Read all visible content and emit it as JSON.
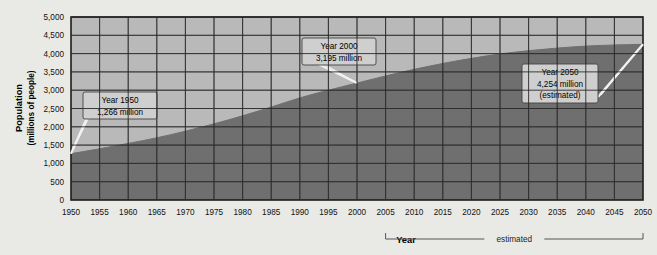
{
  "chart_data": {
    "type": "area",
    "title": "",
    "xlabel": "Year",
    "ylabel": "Population",
    "ylabel_sub": "(millions of people)",
    "xlim": [
      1950,
      2050
    ],
    "ylim": [
      0,
      5000
    ],
    "grid": true,
    "legend": null,
    "y_ticks": [
      "0",
      "500",
      "1,000",
      "1,500",
      "2,000",
      "2,500",
      "3,000",
      "3,500",
      "4,000",
      "4,500",
      "5,000"
    ],
    "y_tick_values": [
      0,
      500,
      1000,
      1500,
      2000,
      2500,
      3000,
      3500,
      4000,
      4500,
      5000
    ],
    "x_ticks": [
      "1950",
      "1955",
      "1960",
      "1965",
      "1970",
      "1975",
      "1980",
      "1985",
      "1990",
      "1995",
      "2000",
      "2005",
      "2010",
      "2015",
      "2020",
      "2025",
      "2030",
      "2035",
      "2040",
      "2045",
      "2050"
    ],
    "x_tick_values": [
      1950,
      1955,
      1960,
      1965,
      1970,
      1975,
      1980,
      1985,
      1990,
      1995,
      2000,
      2005,
      2010,
      2015,
      2020,
      2025,
      2030,
      2035,
      2040,
      2045,
      2050
    ],
    "x": [
      1950,
      1955,
      1960,
      1965,
      1970,
      1975,
      1980,
      1985,
      1990,
      1995,
      2000,
      2005,
      2010,
      2015,
      2020,
      2025,
      2030,
      2035,
      2040,
      2045,
      2050
    ],
    "values": [
      1266,
      1400,
      1545,
      1700,
      1880,
      2080,
      2300,
      2540,
      2790,
      3000,
      3195,
      3390,
      3570,
      3730,
      3870,
      3990,
      4080,
      4150,
      4205,
      4235,
      4254
    ],
    "series": [
      {
        "name": "Population",
        "values": [
          1266,
          1400,
          1545,
          1700,
          1880,
          2080,
          2300,
          2540,
          2790,
          3000,
          3195,
          3390,
          3570,
          3730,
          3870,
          3990,
          4080,
          4150,
          4205,
          4235,
          4254
        ]
      }
    ],
    "annotations": [
      {
        "id": "a1950",
        "lines": [
          "Year 1950",
          "1,266 million"
        ],
        "point_x": 1950,
        "point_y": 1266
      },
      {
        "id": "a2000",
        "lines": [
          "Year 2000",
          "3,195 million"
        ],
        "point_x": 2000,
        "point_y": 3195
      },
      {
        "id": "a2050",
        "lines": [
          "Year 2050",
          "4,254 million",
          "(estimated)"
        ],
        "point_x": 2050,
        "point_y": 4254
      }
    ],
    "estimated_bracket": {
      "label": "estimated",
      "from": 2005,
      "to": 2050
    },
    "colors": {
      "page_background": "#e9e9e6",
      "plot_background": "#b9b9b9",
      "area_fill": "#6f6f6f",
      "grid": "#2b2b2b",
      "axis": "#1c1c1c",
      "callout_fill": "#cfcfcf",
      "callout_border": "#444444",
      "leader_line": "#f2f2f2"
    }
  }
}
